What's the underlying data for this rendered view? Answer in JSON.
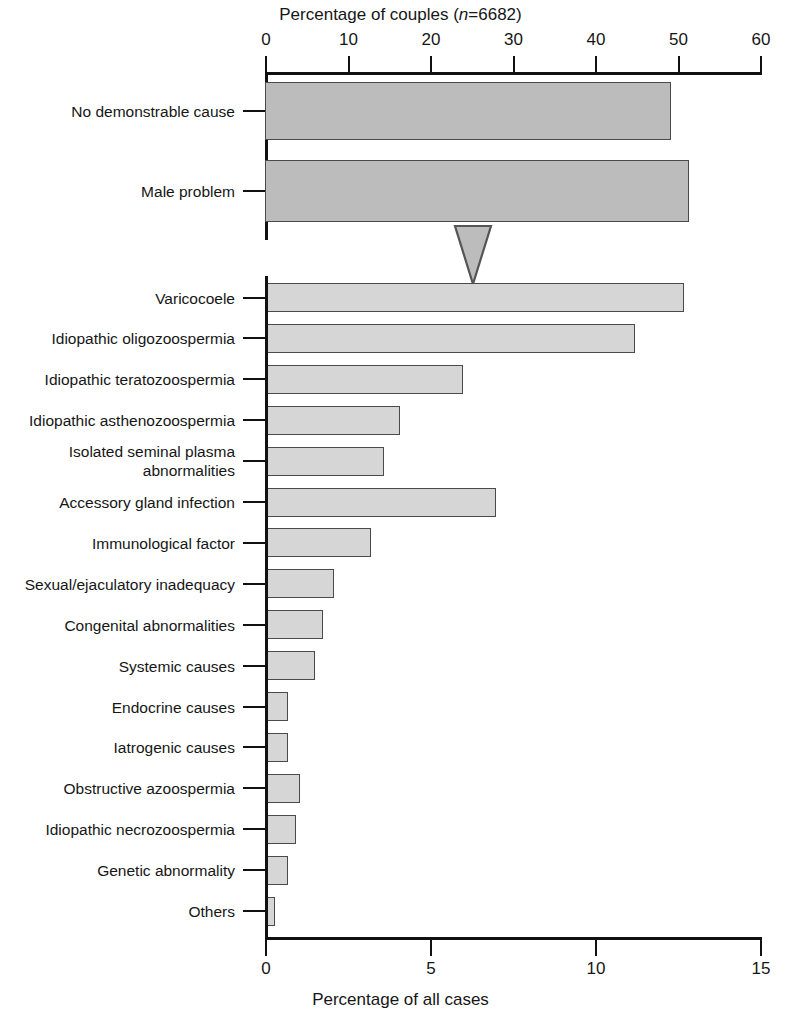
{
  "chart_data": {
    "type": "bar",
    "orientation": "horizontal",
    "title": "",
    "top_axis": {
      "label": "Percentage of couples (n=6682)",
      "label_plain": "Percentage of couples (n=6682)",
      "label_prefix": "Percentage of couples (",
      "label_italic": "n",
      "label_suffix": "=6682)",
      "ticks": [
        0,
        10,
        20,
        30,
        40,
        50,
        60
      ],
      "xlim": [
        0,
        60
      ],
      "position": "top"
    },
    "bottom_axis": {
      "label": "Percentage of all cases",
      "ticks": [
        0,
        5,
        10,
        15
      ],
      "xlim": [
        0,
        15
      ],
      "position": "bottom"
    },
    "grid": false,
    "legend": null,
    "groups": [
      {
        "name": "couples",
        "axis": "top",
        "xlabel": "Percentage of couples (n=6682)",
        "categories": [
          "No demonstrable cause",
          "Male problem"
        ],
        "values": [
          49.2,
          51.4
        ]
      },
      {
        "name": "all cases",
        "axis": "bottom",
        "xlabel": "Percentage of all cases",
        "categories": [
          "Varicocoele",
          "Idiopathic oligozoospermia",
          "Idiopathic teratozoospermia",
          "Idiopathic asthenozoospermia",
          "Isolated seminal plasma abnormalities",
          "Accessory gland infection",
          "Immunological factor",
          "Sexual/ejaculatory inadequacy",
          "Congenital abnormalities",
          "Systemic causes",
          "Endocrine causes",
          "Iatrogenic causes",
          "Obstructive azoospermia",
          "Idiopathic necrozoospermia",
          "Genetic abnormality",
          "Others"
        ],
        "values": [
          12.7,
          11.2,
          6.0,
          4.1,
          3.6,
          7.0,
          3.2,
          2.1,
          1.75,
          1.5,
          0.7,
          0.7,
          1.05,
          0.95,
          0.7,
          0.3
        ]
      }
    ],
    "annotations": [
      {
        "name": "axis-break-marker",
        "shape": "down-triangle",
        "axis": "top",
        "value": 25.2
      }
    ],
    "colors": {
      "top_bar_fill": "#bcbcbc",
      "bottom_bar_fill": "#d6d6d6",
      "bar_stroke": "#4a4a4a",
      "axis": "#111111",
      "text": "#161616",
      "background": "#ffffff"
    }
  },
  "labels": {
    "top_categories": [
      {
        "text": "No demonstrable cause",
        "lines": [
          "No demonstrable cause"
        ]
      },
      {
        "text": "Male problem",
        "lines": [
          "Male problem"
        ]
      }
    ],
    "bottom_categories": [
      {
        "text": "Varicocoele"
      },
      {
        "text": "Idiopathic oligozoospermia"
      },
      {
        "text": "Idiopathic teratozoospermia"
      },
      {
        "text": "Idiopathic asthenozoospermia"
      },
      {
        "text": "Isolated seminal plasma abnormalities"
      },
      {
        "text": "Accessory gland infection"
      },
      {
        "text": "Immunological factor"
      },
      {
        "text": "Sexual/ejaculatory inadequacy"
      },
      {
        "text": "Congenital abnormalities"
      },
      {
        "text": "Systemic causes"
      },
      {
        "text": "Endocrine causes"
      },
      {
        "text": "Iatrogenic causes"
      },
      {
        "text": "Obstructive azoospermia"
      },
      {
        "text": "Idiopathic necrozoospermia"
      },
      {
        "text": "Genetic abnormality"
      },
      {
        "text": "Others"
      }
    ]
  }
}
